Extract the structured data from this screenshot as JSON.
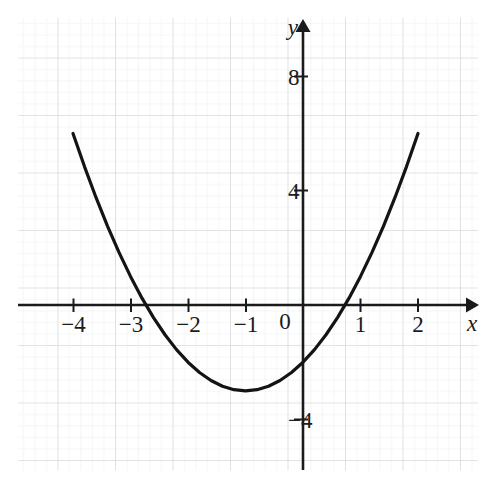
{
  "chart_data": {
    "type": "line",
    "title": "",
    "subtitle": "",
    "xlabel": "x",
    "ylabel": "y",
    "equation": "y = x^2 + 2x - 2",
    "xlim": [
      -4.95,
      3.05
    ],
    "ylim": [
      -5.75,
      9.4
    ],
    "xticks": [
      -4,
      -3,
      -2,
      -1,
      0,
      1,
      2
    ],
    "yticks": [
      8,
      4,
      -4
    ],
    "xtick_labels": [
      "−4",
      "−3",
      "−2",
      "−1",
      "0",
      "1",
      "2"
    ],
    "ytick_labels": [
      "8",
      "4",
      "−4"
    ],
    "grid": true,
    "minor_grid": true,
    "minor_per_major": 5,
    "legend": "none",
    "annotations": [],
    "series": [
      {
        "name": "parabola",
        "color": "#141414",
        "linewidth": 3.2,
        "x": [
          -4,
          -3.8,
          -3.6,
          -3.4,
          -3.2,
          -3,
          -2.8,
          -2.6,
          -2.4,
          -2.2,
          -2,
          -1.8,
          -1.6,
          -1.4,
          -1.2,
          -1,
          -0.8,
          -0.6,
          -0.4,
          -0.2,
          0,
          0.2,
          0.4,
          0.6,
          0.8,
          1,
          1.2,
          1.4,
          1.6,
          1.8,
          2
        ],
        "values": [
          6,
          4.84,
          3.76,
          2.76,
          1.84,
          1,
          0.24,
          -0.44,
          -1.04,
          -1.56,
          -2,
          -2.36,
          -2.64,
          -2.84,
          -2.96,
          -3,
          -2.96,
          -2.84,
          -2.64,
          -2.36,
          -2,
          -1.56,
          -1.04,
          -0.44,
          0.24,
          1,
          1.84,
          2.76,
          3.76,
          4.84,
          6
        ]
      }
    ],
    "roots": [
      -2.73,
      0.73
    ],
    "vertex": [
      -1,
      -3
    ],
    "y_intercept": -2
  },
  "axes": {
    "x_axis_label": "x",
    "y_axis_label": "y",
    "x_arrow": "arrow-right",
    "y_arrow": "arrow-up"
  },
  "colors": {
    "curve": "#141414",
    "axis": "#1b1b1b",
    "major_grid": "#cfd2d6",
    "minor_grid": "#e9ebee",
    "text": "#1b1b1b",
    "background": "#ffffff"
  }
}
